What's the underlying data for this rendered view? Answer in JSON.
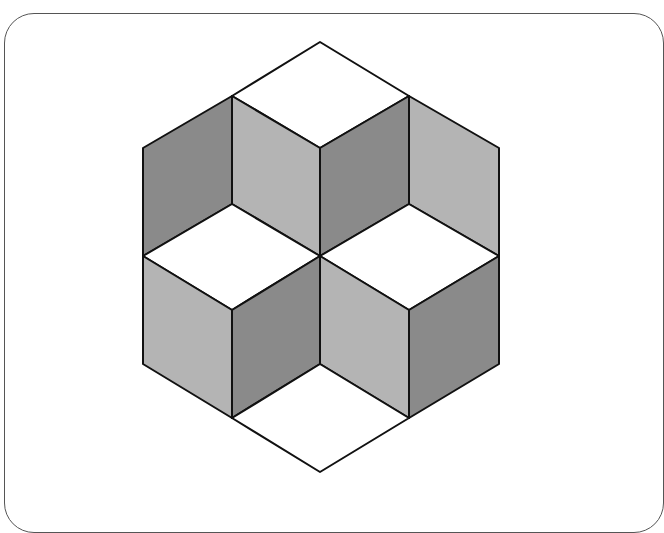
{
  "diagram": {
    "colors": {
      "background": "#ffffff",
      "frame": "#555555",
      "outline": "#111111",
      "top_face": "#ffffff",
      "light_face": "#b4b4b4",
      "dark_face": "#8a8a8a"
    },
    "faces": [
      {
        "name": "top-rhombus",
        "shade": "top_face",
        "points": "320,42 409,96 320,148 232,96"
      },
      {
        "name": "upper-left-outer-face",
        "shade": "dark_face",
        "points": "143,148 232,96 232,204 143,256"
      },
      {
        "name": "upper-center-left-face",
        "shade": "light_face",
        "points": "232,96 320,148 320,256 232,204"
      },
      {
        "name": "upper-center-right-face",
        "shade": "dark_face",
        "points": "320,148 409,96 409,204 320,256"
      },
      {
        "name": "upper-right-outer-face",
        "shade": "light_face",
        "points": "409,96 499,148 499,256 409,204"
      },
      {
        "name": "left-cube-top",
        "shade": "top_face",
        "points": "232,204 320,256 232,310 143,256"
      },
      {
        "name": "right-cube-top",
        "shade": "top_face",
        "points": "409,204 499,256 409,310 320,256"
      },
      {
        "name": "left-cube-light-face",
        "shade": "light_face",
        "points": "143,256 232,310 232,418 143,364"
      },
      {
        "name": "left-cube-dark-face",
        "shade": "dark_face",
        "points": "232,310 320,256 320,364 232,418"
      },
      {
        "name": "right-cube-light-face",
        "shade": "light_face",
        "points": "320,256 409,310 409,418 320,364"
      },
      {
        "name": "right-cube-dark-face",
        "shade": "dark_face",
        "points": "409,310 499,256 499,364 409,418"
      },
      {
        "name": "bottom-rhombus",
        "shade": "top_face",
        "points": "320,364 409,418 320,472 232,418"
      }
    ]
  }
}
